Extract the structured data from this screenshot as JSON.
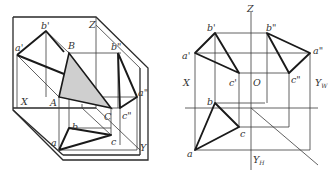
{
  "figure": {
    "type": "orthographic projection diagram",
    "colors": {
      "line": "#2a2a2a",
      "triangle_fill": "#cfcfcf",
      "background": "#ffffff"
    }
  },
  "left_view": {
    "title": "pictorial (axonometric) view of triangle ABC in three projection planes",
    "labels": {
      "b_prime": "b'",
      "a_prime": "a'",
      "B": "B",
      "Z": "Z",
      "b_dprime": "b\"",
      "a_dprime": "a\"",
      "X": "X",
      "A": "A",
      "C": "C",
      "c_dprime": "c\"",
      "b": "b",
      "a": "a",
      "c": "c",
      "Y": "Y"
    }
  },
  "right_view": {
    "title": "three-view projection of triangle",
    "labels": {
      "Z": "Z",
      "b_prime": "b'",
      "b_dprime": "b\"",
      "a_prime": "a'",
      "a_dprime": "a\"",
      "c_prime": "c'",
      "c_dprime": "c\"",
      "X": "X",
      "O": "O",
      "Y_W": "Y",
      "Y_W_sub": "W",
      "b": "b",
      "c": "c",
      "a": "a",
      "Y_H": "Y",
      "Y_H_sub": "H"
    }
  }
}
